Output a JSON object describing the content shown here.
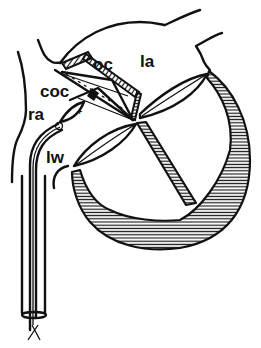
{
  "figure": {
    "type": "anatomical line drawing",
    "labels": {
      "oc": "oc",
      "la": "la",
      "coc": "coc",
      "ra": "ra",
      "lw": "lw"
    },
    "markers": {
      "plus": "+"
    },
    "colors": {
      "ink": "#111111",
      "background": "#ffffff"
    }
  }
}
